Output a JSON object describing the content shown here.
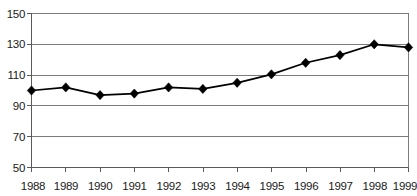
{
  "chart_data": {
    "type": "line",
    "title": "Sales relative to sector 1988 = 100",
    "xlabel": "",
    "ylabel": "",
    "categories": [
      "1988",
      "1989",
      "1990",
      "1991",
      "1992",
      "1993",
      "1994",
      "1995",
      "1996",
      "1997",
      "1998",
      "1999"
    ],
    "values": [
      100,
      102,
      97,
      98,
      102,
      101,
      105,
      110.5,
      118,
      123,
      130,
      128
    ],
    "series": [
      {
        "name": "Sales index",
        "values": [
          100,
          102,
          97,
          98,
          102,
          101,
          105,
          110.5,
          118,
          123,
          130,
          128
        ]
      }
    ],
    "ylim": [
      50,
      150
    ],
    "ytick_labels": [
      "150",
      "130",
      "110",
      "90",
      "70",
      "50"
    ],
    "ytick_values": [
      150,
      130,
      110,
      90,
      70,
      50
    ],
    "xtick_labels": [
      "1988",
      "1989",
      "1990",
      "1991",
      "1992",
      "1993",
      "1994",
      "1995",
      "1996",
      "1997",
      "1998",
      "1999"
    ],
    "grid": true,
    "legend": null,
    "marker": "diamond",
    "line_color": "#000000",
    "grid_color": "#6e6e6e",
    "background_color": "#ffffff"
  }
}
